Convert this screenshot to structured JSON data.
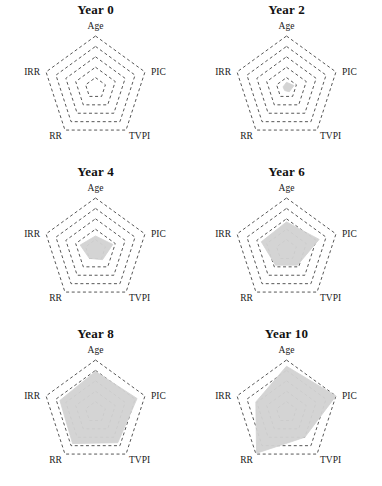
{
  "figure": {
    "type": "small-multiples-radar",
    "panel_count": 6,
    "axes": [
      "Age",
      "PIC",
      "TVPI",
      "RR",
      "IRR"
    ],
    "ring_count": 5,
    "fill_color": "#d2d2d2",
    "grid_color": "#444444",
    "background": "#ffffff"
  },
  "panels": [
    {
      "title": "Year 0"
    },
    {
      "title": "Year 2"
    },
    {
      "title": "Year 4"
    },
    {
      "title": "Year 6"
    },
    {
      "title": "Year 8"
    },
    {
      "title": "Year 10"
    }
  ],
  "labels": {
    "age": "Age",
    "pic": "PIC",
    "tvpi": "TVPI",
    "rr": "RR",
    "irr": "IRR"
  },
  "chart_data": {
    "type": "radar",
    "title": "",
    "categories": [
      "Age",
      "PIC",
      "TVPI",
      "RR",
      "IRR"
    ],
    "rmax": 5,
    "ring_count": 5,
    "grid": true,
    "grid_style": "dashed",
    "legend": "none",
    "shape": "polygon",
    "series": [
      {
        "name": "Year 0",
        "values": [
          0.0,
          0.0,
          0.0,
          0.0,
          0.0
        ]
      },
      {
        "name": "Year 2",
        "values": [
          0.55,
          0.75,
          0.45,
          0.3,
          0.35
        ]
      },
      {
        "name": "Year 4",
        "values": [
          1.35,
          1.75,
          1.15,
          1.0,
          1.55
        ]
      },
      {
        "name": "Year 6",
        "values": [
          2.7,
          3.3,
          1.8,
          1.8,
          2.55
        ]
      },
      {
        "name": "Year 8",
        "values": [
          3.9,
          4.2,
          3.65,
          3.75,
          3.6
        ]
      },
      {
        "name": "Year 10",
        "values": [
          4.4,
          5.0,
          3.0,
          4.9,
          3.1
        ]
      }
    ]
  }
}
